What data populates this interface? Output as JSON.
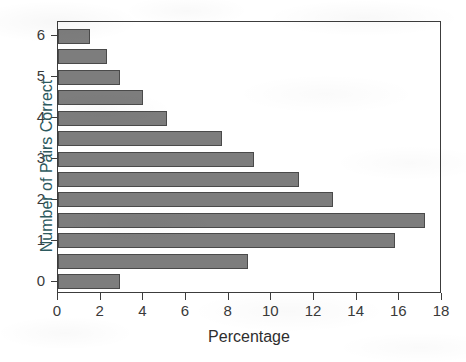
{
  "chart_data": {
    "type": "bar",
    "orientation": "horizontal",
    "title": "",
    "xlabel": "Percentage",
    "ylabel": "Number of Pairs Correct",
    "xlim": [
      0,
      18
    ],
    "ylim": [
      -0.3,
      6.35
    ],
    "xticks": [
      0,
      2,
      4,
      6,
      8,
      10,
      12,
      14,
      16,
      18
    ],
    "yticks": [
      0,
      1,
      2,
      3,
      4,
      5,
      6
    ],
    "xtick_labels": [
      "0",
      "2",
      "4",
      "6",
      "8",
      "10",
      "12",
      "14",
      "16",
      "18"
    ],
    "ytick_labels": [
      "0",
      "1",
      "2",
      "3",
      "4",
      "5",
      "6"
    ],
    "grid": false,
    "legend": false,
    "bar_fill_color": "#7d7d7d",
    "bar_edge_color": "#4a4a4a",
    "frame_color": "#3c3c3c",
    "ylabel_color": "#2d5a5e",
    "xlabel_color": "#2e2e2e",
    "categories": [
      0,
      0.5,
      1,
      1.5,
      2,
      2.5,
      3,
      3.5,
      4,
      4.5,
      5,
      5.5,
      6
    ],
    "values": [
      2.9,
      8.9,
      15.8,
      17.2,
      12.9,
      11.3,
      9.2,
      7.7,
      5.1,
      4.0,
      2.9,
      2.3,
      1.5
    ],
    "bars": [
      {
        "category": "6",
        "value": 1.5
      },
      {
        "category": "5.5",
        "value": 2.3
      },
      {
        "category": "5",
        "value": 2.9
      },
      {
        "category": "4.5",
        "value": 4.0
      },
      {
        "category": "4",
        "value": 5.1
      },
      {
        "category": "3.5",
        "value": 7.7
      },
      {
        "category": "3",
        "value": 9.2
      },
      {
        "category": "2.5",
        "value": 11.3
      },
      {
        "category": "2",
        "value": 12.9
      },
      {
        "category": "1.5",
        "value": 17.2
      },
      {
        "category": "1",
        "value": 15.8
      },
      {
        "category": "0.5",
        "value": 8.9
      },
      {
        "category": "0",
        "value": 2.9
      }
    ]
  }
}
